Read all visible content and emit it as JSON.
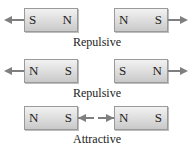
{
  "rows": [
    {
      "left_magnet": {
        "left_pole": "S",
        "right_pole": "N"
      },
      "right_magnet": {
        "left_pole": "N",
        "right_pole": "S"
      },
      "force_direction": "outward",
      "label": "Repulsive"
    },
    {
      "left_magnet": {
        "left_pole": "N",
        "right_pole": "S"
      },
      "right_magnet": {
        "left_pole": "S",
        "right_pole": "N"
      },
      "force_direction": "outward",
      "label": "Repulsive"
    },
    {
      "left_magnet": {
        "left_pole": "N",
        "right_pole": "S"
      },
      "right_magnet": {
        "left_pole": "N",
        "right_pole": "S"
      },
      "force_direction": "inward",
      "label": "Attractive"
    }
  ],
  "colors": {
    "arrow": "#7f7f7f",
    "magnet_border": "#9a9a9a",
    "text": "#222222"
  }
}
